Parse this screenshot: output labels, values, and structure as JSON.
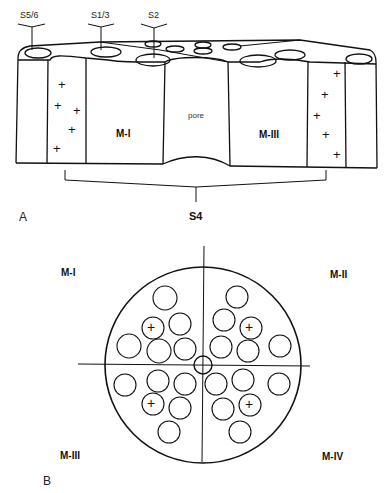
{
  "panel_a": {
    "label": "A",
    "segment_labels": {
      "s56": "S5/6",
      "s13": "S1/3",
      "s2": "S2",
      "s4": "S4"
    },
    "domain_labels": {
      "left": "M-I",
      "right": "M-III"
    },
    "pore_label": "pore",
    "charge_symbol": "+"
  },
  "panel_b": {
    "label": "B",
    "quadrant_labels": {
      "top_left": "M-I",
      "top_right": "M-II",
      "bottom_left": "M-III",
      "bottom_right": "M-IV"
    },
    "charge_symbol": "+"
  },
  "colors": {
    "line": "#111111",
    "background": "#ffffff"
  }
}
